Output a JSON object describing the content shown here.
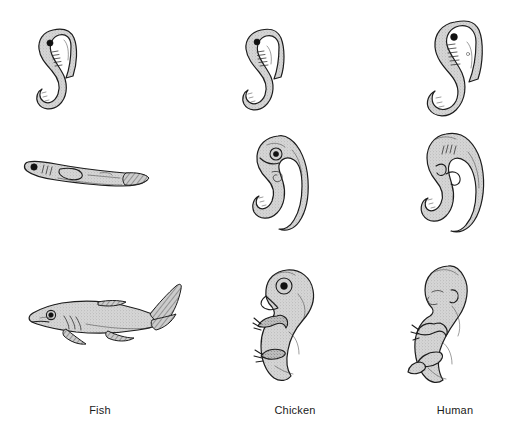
{
  "figure": {
    "type": "comparative-embryology-grid",
    "background_color": "#ffffff",
    "ink_color": "#1d1d1d",
    "shading_color": "#c9c9c9",
    "columns": 3,
    "rows": 3,
    "caption": ""
  },
  "columns": [
    {
      "id": "fish",
      "label": "Fish",
      "label_x": 100,
      "label_y": 405,
      "stages": [
        {
          "stage": 1,
          "description": "early comma-shaped embryo with dark eye spot, somite ridges and curled tail",
          "orientation": "vertical-hook",
          "features": [
            "eye-spot",
            "somites",
            "curled-tail"
          ]
        },
        {
          "stage": 2,
          "description": "elongated horizontal larva with dark eye, gill slits, yolk sac and tail fin",
          "orientation": "horizontal",
          "features": [
            "eye",
            "gill-slits",
            "yolk-sac",
            "tail-fin"
          ]
        },
        {
          "stage": 3,
          "description": "recognizable shark-like fish with pointed snout, gill slits, pectoral and pelvic fins and upswept caudal fin",
          "orientation": "horizontal",
          "features": [
            "eye",
            "gill-slits",
            "pectoral-fin",
            "pelvic-fin",
            "dorsal-fin",
            "caudal-fin"
          ]
        }
      ]
    },
    {
      "id": "chicken",
      "label": "Chicken",
      "label_x": 295,
      "label_y": 405,
      "stages": [
        {
          "stage": 1,
          "description": "early comma-shaped embryo nearly identical to the fish stage, dark eye spot, somites, curled tail",
          "orientation": "vertical-hook",
          "features": [
            "eye-spot",
            "somites",
            "curled-tail"
          ]
        },
        {
          "stage": 2,
          "description": "C-curved embryo with enlarged head, ringed eye, forming beak and limb buds",
          "orientation": "vertical-curled",
          "features": [
            "eye-ring",
            "beak-bud",
            "limb-buds",
            "tail"
          ]
        },
        {
          "stage": 3,
          "description": "bird-like embryo with pronounced beak, large ringed eye, wing and clawed foot",
          "orientation": "vertical-upright",
          "features": [
            "beak",
            "eye-ring",
            "wing",
            "clawed-foot",
            "tail"
          ]
        }
      ]
    },
    {
      "id": "human",
      "label": "Human",
      "label_x": 455,
      "label_y": 405,
      "stages": [
        {
          "stage": 1,
          "description": "early comma-shaped embryo with bulbous head, dark eye, pharyngeal arches and curled tail",
          "orientation": "vertical-hook",
          "features": [
            "eye-spot",
            "pharyngeal-arches",
            "somites",
            "curled-tail"
          ]
        },
        {
          "stage": 2,
          "description": "C-curved embryo with large head, pharyngeal arch lines, limb buds and visible tail",
          "orientation": "vertical-curled",
          "features": [
            "pharyngeal-arches",
            "limb-buds",
            "tail"
          ]
        },
        {
          "stage": 3,
          "description": "recognizable human fetus with rounded head, ear, closed eyes, arms with fingers and bent legs",
          "orientation": "vertical-upright",
          "features": [
            "ear",
            "closed-eye",
            "nose",
            "arm",
            "hand-fingers",
            "leg",
            "foot"
          ]
        }
      ]
    }
  ]
}
